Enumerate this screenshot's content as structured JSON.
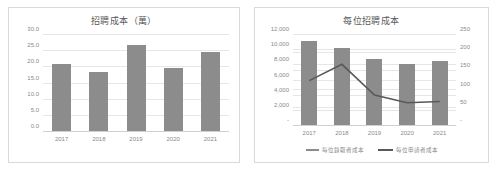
{
  "charts": [
    {
      "title": "招聘成本（萬）",
      "legend": []
    },
    {
      "title": "每位招聘成本",
      "legend": [
        {
          "label": "每位錄取者成本",
          "marker": "bar-swatch",
          "color": "#8c8c8c"
        },
        {
          "label": "每位申請者成本",
          "marker": "line-swatch",
          "color": "#595959"
        }
      ]
    }
  ],
  "chart_data": [
    {
      "type": "bar",
      "title": "招聘成本（萬）",
      "xlabel": "",
      "ylabel": "",
      "categories": [
        "2017",
        "2018",
        "2019",
        "2020",
        "2021"
      ],
      "values": [
        21.1,
        18.6,
        26.8,
        19.9,
        24.8
      ],
      "ylim": [
        0,
        30
      ],
      "yticks": [
        "0.0",
        "5.0",
        "10.0",
        "15.0",
        "20.0",
        "25.0",
        "30.0"
      ],
      "ytick_values": [
        0,
        5,
        10,
        15,
        20,
        25,
        30
      ],
      "grid": true,
      "legend_position": "none",
      "bar_color": "#8c8c8c"
    },
    {
      "type": "bar+line",
      "title": "每位招聘成本",
      "xlabel": "",
      "categories": [
        "2017",
        "2018",
        "2019",
        "2020",
        "2021"
      ],
      "series": [
        {
          "name": "每位錄取者成本",
          "type": "bar",
          "axis": "left",
          "color": "#8c8c8c",
          "values": [
            11200,
            10300,
            8900,
            8150,
            8600
          ]
        },
        {
          "name": "每位申請者成本",
          "type": "line",
          "axis": "right",
          "color": "#595959",
          "values": [
            180,
            205,
            158,
            146,
            148
          ]
        }
      ],
      "ylim": [
        0,
        12000
      ],
      "yticks": [
        "-",
        "2,000",
        "4,000",
        "6,000",
        "8,000",
        "10,000",
        "12,000"
      ],
      "ytick_values": [
        0,
        2000,
        4000,
        6000,
        8000,
        10000,
        12000
      ],
      "y2lim": [
        0,
        250
      ],
      "y2ticks": [
        "-",
        "50",
        "100",
        "150",
        "200",
        "250"
      ],
      "y2tick_values": [
        0,
        50,
        100,
        150,
        200,
        250
      ],
      "grid": true,
      "legend_position": "bottom"
    }
  ]
}
